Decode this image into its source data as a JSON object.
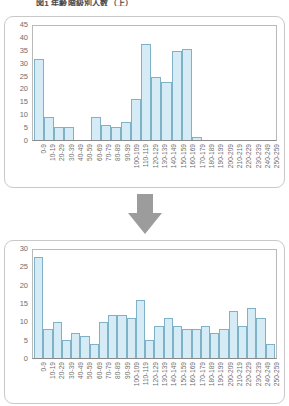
{
  "title": "図1 年齢階級別人数（上）",
  "colors": {
    "bar_fill": "#d5ecf6",
    "bar_stroke": "#7fb2c6",
    "panel_border": "#c9c9c9",
    "axis": "#8a8a8a",
    "arrow": "#9c9c9c",
    "text": "#6e6e6e"
  },
  "arrow": {
    "icon": "arrow-down-icon"
  },
  "chart_data": [
    {
      "type": "bar",
      "title": "",
      "xlabel": "",
      "ylabel": "",
      "ylim": [
        0,
        45
      ],
      "yticks": [
        0,
        5,
        10,
        15,
        20,
        25,
        30,
        35,
        40,
        45
      ],
      "grid": false,
      "legend": "none",
      "categories": [
        "0-9",
        "10-19",
        "20-29",
        "30-39",
        "40-49",
        "50-59",
        "60-69",
        "70-79",
        "80-89",
        "90-99",
        "100-109",
        "110-119",
        "120-129",
        "130-139",
        "140-149",
        "150-159",
        "160-169",
        "170-179",
        "180-189",
        "190-199",
        "200-209",
        "210-219",
        "220-229",
        "230-239",
        "240-249",
        "250-259"
      ],
      "values": [
        32,
        9,
        5,
        5,
        0,
        0,
        9,
        6,
        5,
        7,
        16,
        38,
        25,
        23,
        35,
        36,
        1,
        0,
        0,
        0,
        0,
        0,
        0,
        0,
        0,
        0
      ]
    },
    {
      "type": "bar",
      "title": "",
      "xlabel": "",
      "ylabel": "",
      "ylim": [
        0,
        30
      ],
      "yticks": [
        0,
        5,
        10,
        15,
        20,
        25,
        30
      ],
      "grid": false,
      "legend": "none",
      "categories": [
        "0-9",
        "10-19",
        "20-29",
        "30-39",
        "40-49",
        "50-59",
        "60-69",
        "70-79",
        "80-89",
        "90-99",
        "100-109",
        "110-119",
        "120-129",
        "130-139",
        "140-149",
        "150-159",
        "160-169",
        "170-179",
        "180-189",
        "190-199",
        "200-209",
        "210-219",
        "220-229",
        "230-239",
        "240-249",
        "250-259"
      ],
      "values": [
        28,
        8,
        10,
        5,
        7,
        6,
        4,
        10,
        12,
        12,
        11,
        16,
        5,
        9,
        11,
        9,
        8,
        8,
        9,
        7,
        8,
        13,
        9,
        14,
        11,
        4
      ]
    }
  ]
}
